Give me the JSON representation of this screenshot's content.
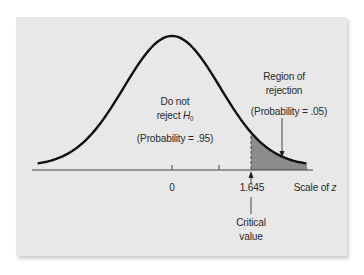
{
  "figure": {
    "center_label_line1": "Do not",
    "center_label_line2_prefix": "reject ",
    "center_label_h": "H",
    "center_label_sub": "0",
    "center_probability": "(Probability = .95)",
    "rejection_label_line1": "Region of",
    "rejection_label_line2": "rejection",
    "rejection_probability": "(Probability = .05)",
    "tick_zero": "0",
    "tick_critical": "1.645",
    "axis_label_prefix": "Scale of ",
    "axis_label_var": "z",
    "critical_label_line1": "Critical",
    "critical_label_line2": "value",
    "colors": {
      "panel": "#e8e8e9",
      "curve": "#111111",
      "shade": "#8c8c8d",
      "axis": "#444444"
    }
  },
  "chart_data": {
    "type": "area",
    "title": "",
    "xlabel": "Scale of z",
    "ylabel": "",
    "x_ticks": [
      0,
      1,
      1.645
    ],
    "x_tick_labels": [
      "0",
      "",
      "1.645"
    ],
    "critical_value": 1.645,
    "regions": [
      {
        "name": "Do not reject H0",
        "range": [
          -3.5,
          1.645
        ],
        "probability": 0.95
      },
      {
        "name": "Region of rejection",
        "range": [
          1.645,
          2.8
        ],
        "probability": 0.05,
        "shaded": true
      }
    ],
    "annotations": [
      "Critical value"
    ]
  }
}
